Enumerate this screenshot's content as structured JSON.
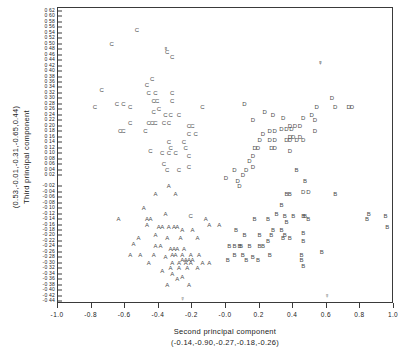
{
  "chart_data": {
    "type": "scatter",
    "title": "",
    "xlabel": "Second principal component",
    "xlabel_sub": "(-0.14,-0.90,-0.27,-0.18,-0.26)",
    "ylabel": "Third principal component",
    "ylabel_sub": "(0.53,-0.01,-0.31,-0.65,0.44)",
    "xlim": [
      -1.0,
      1.0
    ],
    "ylim": [
      -0.45,
      0.63
    ],
    "grid": false,
    "legend": "none",
    "x_ticks": [
      -1.0,
      -0.8,
      -0.6,
      -0.4,
      -0.2,
      -0.0,
      0.2,
      0.4,
      0.6,
      0.8,
      1.0
    ],
    "x_tick_labels": [
      "-1.0",
      "-0.8",
      "-0.6",
      "-0.4",
      "-0.2",
      "-0.0",
      "0.2",
      "0.4",
      "0.6",
      "0.8",
      "1.0"
    ],
    "y_ticks": [
      0.62,
      0.6,
      0.58,
      0.56,
      0.54,
      0.52,
      0.5,
      0.48,
      0.46,
      0.44,
      0.42,
      0.4,
      0.38,
      0.36,
      0.34,
      0.32,
      0.3,
      0.28,
      0.26,
      0.24,
      0.22,
      0.2,
      0.18,
      0.16,
      0.14,
      0.12,
      0.1,
      0.08,
      0.06,
      0.04,
      0.02,
      -0.02,
      -0.04,
      -0.06,
      -0.08,
      -0.1,
      -0.12,
      -0.14,
      -0.16,
      -0.18,
      -0.2,
      -0.22,
      -0.24,
      -0.26,
      -0.28,
      -0.3,
      -0.32,
      -0.34,
      -0.36,
      -0.38,
      -0.4,
      -0.42,
      -0.44
    ],
    "y_tick_labels": [
      "0 62",
      "0 60",
      "0 58",
      "0 56",
      "0 54",
      "0 52",
      "0 50",
      "0 48",
      "0 46",
      "0 44",
      "0 42",
      "0 40",
      "0 38",
      "0 36",
      "0 34",
      "0 32",
      "0 30",
      "0 28",
      "0 26",
      "0 24",
      "0 22",
      "0 20",
      "0 18",
      "0 16",
      "0 14",
      "0 12",
      "0 10",
      "0 08",
      "0 06",
      "0 04",
      "0 02",
      "-0 02",
      "-0 04",
      "-0 06",
      "-0 08",
      "-0 10",
      "-0 12",
      "-0 14",
      "-0 16",
      "-0 18",
      "-0 20",
      "-0 22",
      "-0 24",
      "-0 26",
      "-0 28",
      "-0 30",
      "-0 32",
      "-0 34",
      "-0 36",
      "-0 38",
      "-0 40",
      "-0 42",
      "-0 44"
    ],
    "marker_style": "letter-glyph",
    "series": [
      {
        "name": "A",
        "label": "A",
        "marker": "A",
        "color": "#4a4a4a",
        "points": [
          [
            -0.64,
            -0.14
          ],
          [
            -0.49,
            -0.1
          ],
          [
            -0.47,
            -0.14
          ],
          [
            -0.47,
            -0.16
          ],
          [
            -0.4,
            -0.17
          ],
          [
            -0.38,
            -0.17
          ],
          [
            -0.34,
            -0.17
          ],
          [
            -0.31,
            -0.17
          ],
          [
            -0.29,
            -0.17
          ],
          [
            -0.42,
            -0.2
          ],
          [
            -0.52,
            -0.21
          ],
          [
            -0.35,
            -0.21
          ],
          [
            -0.27,
            -0.21
          ],
          [
            -0.55,
            -0.23
          ],
          [
            -0.42,
            -0.24
          ],
          [
            -0.39,
            -0.24
          ],
          [
            -0.33,
            -0.25
          ],
          [
            -0.31,
            -0.25
          ],
          [
            -0.29,
            -0.25
          ],
          [
            -0.25,
            -0.25
          ],
          [
            -0.57,
            -0.27
          ],
          [
            -0.51,
            -0.27
          ],
          [
            -0.43,
            -0.27
          ],
          [
            -0.32,
            -0.27
          ],
          [
            -0.3,
            -0.27
          ],
          [
            -0.26,
            -0.27
          ],
          [
            -0.21,
            -0.27
          ],
          [
            -0.36,
            -0.28
          ],
          [
            -0.26,
            -0.29
          ],
          [
            -0.24,
            -0.29
          ],
          [
            -0.22,
            -0.29
          ],
          [
            -0.2,
            -0.29
          ],
          [
            -0.16,
            -0.27
          ],
          [
            -0.46,
            -0.3
          ],
          [
            -0.32,
            -0.3
          ],
          [
            -0.28,
            -0.3
          ],
          [
            -0.24,
            -0.3
          ],
          [
            -0.21,
            -0.3
          ],
          [
            -0.14,
            -0.3
          ],
          [
            -0.1,
            -0.3
          ],
          [
            -0.33,
            -0.32
          ],
          [
            -0.28,
            -0.32
          ],
          [
            -0.23,
            -0.32
          ],
          [
            -0.17,
            -0.32
          ],
          [
            -0.38,
            -0.33
          ],
          [
            -0.32,
            -0.34
          ],
          [
            -0.26,
            -0.35
          ],
          [
            -0.29,
            -0.36
          ],
          [
            -0.35,
            -0.38
          ],
          [
            -0.22,
            -0.38
          ],
          [
            -0.45,
            -0.14
          ],
          [
            -0.36,
            -0.12
          ],
          [
            -0.3,
            -0.05
          ],
          [
            -0.12,
            -0.14
          ],
          [
            -0.1,
            -0.16
          ],
          [
            -0.04,
            -0.16
          ],
          [
            -0.2,
            -0.18
          ],
          [
            -0.17,
            -0.21
          ],
          [
            -0.26,
            -0.18
          ],
          [
            -0.42,
            -0.05
          ],
          [
            -0.34,
            -0.02
          ]
        ]
      },
      {
        "name": "B",
        "label": "B",
        "marker": "B",
        "color": "#4a4a4a",
        "points": [
          [
            0.33,
            -0.09
          ],
          [
            0.3,
            -0.12
          ],
          [
            0.35,
            -0.13
          ],
          [
            0.4,
            -0.13
          ],
          [
            0.46,
            -0.13
          ],
          [
            0.85,
            -0.12
          ],
          [
            0.84,
            -0.14
          ],
          [
            0.25,
            -0.14
          ],
          [
            0.36,
            -0.15
          ],
          [
            0.17,
            -0.14
          ],
          [
            0.49,
            -0.14
          ],
          [
            0.28,
            -0.18
          ],
          [
            0.33,
            -0.18
          ],
          [
            0.35,
            -0.2
          ],
          [
            0.46,
            -0.19
          ],
          [
            0.06,
            -0.18
          ],
          [
            0.11,
            -0.2
          ],
          [
            0.2,
            -0.2
          ],
          [
            0.27,
            -0.2
          ],
          [
            0.34,
            -0.21
          ],
          [
            0.38,
            -0.21
          ],
          [
            0.25,
            -0.22
          ],
          [
            0.46,
            -0.22
          ],
          [
            0.02,
            -0.24
          ],
          [
            0.05,
            -0.24
          ],
          [
            0.08,
            -0.24
          ],
          [
            0.09,
            -0.24
          ],
          [
            0.14,
            -0.24
          ],
          [
            0.2,
            -0.24
          ],
          [
            0.22,
            -0.24
          ],
          [
            0.05,
            -0.27
          ],
          [
            0.1,
            -0.27
          ],
          [
            0.16,
            -0.28
          ],
          [
            0.26,
            -0.27
          ],
          [
            0.45,
            -0.27
          ],
          [
            0.45,
            -0.29
          ],
          [
            0.57,
            -0.26
          ],
          [
            0.01,
            -0.29
          ],
          [
            0.12,
            -0.29
          ],
          [
            0.19,
            -0.29
          ],
          [
            0.47,
            -0.13
          ],
          [
            0.46,
            -0.31
          ],
          [
            0.36,
            -0.05
          ],
          [
            0.38,
            -0.05
          ],
          [
            0.65,
            -0.05
          ],
          [
            0.95,
            -0.13
          ],
          [
            0.96,
            -0.17
          ],
          [
            0.47,
            0.0
          ],
          [
            0.42,
            0.04
          ]
        ]
      },
      {
        "name": "C",
        "label": "C",
        "marker": "C",
        "color": "#4a4a4a",
        "points": [
          [
            -0.53,
            0.55
          ],
          [
            -0.68,
            0.5
          ],
          [
            -0.35,
            0.47
          ],
          [
            -0.74,
            0.33
          ],
          [
            -0.78,
            0.27
          ],
          [
            -0.65,
            0.28
          ],
          [
            -0.61,
            0.28
          ],
          [
            -0.57,
            0.27
          ],
          [
            -0.47,
            0.35
          ],
          [
            -0.44,
            0.37
          ],
          [
            -0.46,
            0.32
          ],
          [
            -0.42,
            0.32
          ],
          [
            -0.43,
            0.29
          ],
          [
            -0.41,
            0.29
          ],
          [
            -0.32,
            0.32
          ],
          [
            -0.32,
            0.29
          ],
          [
            -0.43,
            0.25
          ],
          [
            -0.4,
            0.26
          ],
          [
            -0.36,
            0.24
          ],
          [
            -0.33,
            0.24
          ],
          [
            -0.28,
            0.24
          ],
          [
            -0.57,
            0.21
          ],
          [
            -0.46,
            0.21
          ],
          [
            -0.44,
            0.21
          ],
          [
            -0.42,
            0.21
          ],
          [
            -0.37,
            0.21
          ],
          [
            -0.34,
            0.21
          ],
          [
            -0.48,
            0.18
          ],
          [
            -0.63,
            0.18
          ],
          [
            -0.61,
            0.18
          ],
          [
            -0.22,
            0.2
          ],
          [
            -0.2,
            0.2
          ],
          [
            -0.22,
            0.17
          ],
          [
            -0.18,
            0.17
          ],
          [
            -0.34,
            0.14
          ],
          [
            -0.33,
            0.12
          ],
          [
            -0.45,
            0.11
          ],
          [
            -0.38,
            0.1
          ],
          [
            -0.34,
            0.1
          ],
          [
            -0.3,
            0.1
          ],
          [
            -0.22,
            0.09
          ],
          [
            -0.24,
            0.12
          ],
          [
            -0.25,
            0.14
          ],
          [
            -0.37,
            0.06
          ],
          [
            -0.35,
            0.04
          ],
          [
            -0.28,
            0.04
          ],
          [
            -0.22,
            0.05
          ],
          [
            -0.14,
            0.27
          ],
          [
            -0.32,
            0.45
          ],
          [
            -0.21,
            -0.13
          ]
        ]
      },
      {
        "name": "D",
        "label": "D",
        "marker": "D",
        "color": "#4a4a4a",
        "points": [
          [
            0.63,
            0.3
          ],
          [
            0.65,
            0.27
          ],
          [
            0.73,
            0.27
          ],
          [
            0.75,
            0.27
          ],
          [
            0.54,
            0.27
          ],
          [
            0.51,
            0.24
          ],
          [
            0.46,
            0.23
          ],
          [
            0.53,
            0.22
          ],
          [
            0.28,
            0.24
          ],
          [
            0.16,
            0.22
          ],
          [
            0.38,
            0.2
          ],
          [
            0.41,
            0.2
          ],
          [
            0.44,
            0.2
          ],
          [
            0.33,
            0.19
          ],
          [
            0.36,
            0.19
          ],
          [
            0.39,
            0.19
          ],
          [
            0.26,
            0.18
          ],
          [
            0.29,
            0.18
          ],
          [
            0.22,
            0.17
          ],
          [
            0.53,
            0.18
          ],
          [
            0.38,
            0.16
          ],
          [
            0.4,
            0.16
          ],
          [
            0.44,
            0.16
          ],
          [
            0.2,
            0.15
          ],
          [
            0.26,
            0.15
          ],
          [
            0.29,
            0.15
          ],
          [
            0.36,
            0.15
          ],
          [
            0.38,
            0.15
          ],
          [
            0.42,
            0.15
          ],
          [
            0.46,
            0.15
          ],
          [
            0.17,
            0.12
          ],
          [
            0.19,
            0.12
          ],
          [
            0.27,
            0.12
          ],
          [
            0.29,
            0.12
          ],
          [
            0.38,
            0.11
          ],
          [
            0.16,
            0.09
          ],
          [
            0.14,
            0.07
          ],
          [
            0.16,
            0.05
          ],
          [
            0.12,
            0.04
          ],
          [
            0.05,
            0.04
          ],
          [
            0.1,
            0.02
          ],
          [
            0.07,
            0.0
          ],
          [
            0.0,
            0.01
          ],
          [
            0.08,
            -0.02
          ],
          [
            0.46,
            -0.04
          ],
          [
            0.49,
            -0.04
          ],
          [
            0.11,
            0.28
          ],
          [
            0.23,
            0.25
          ],
          [
            0.34,
            0.23
          ]
        ]
      },
      {
        "name": "bold-markers",
        "label": "bold",
        "marker": "filled",
        "color": "#000000",
        "points": [
          [
            -0.36,
            0.48
          ],
          [
            0.56,
            0.43
          ]
        ]
      },
      {
        "name": "open-circle-markers",
        "label": "open",
        "marker": "circle",
        "color": "#555555",
        "points": [
          [
            -0.26,
            -0.43
          ],
          [
            0.6,
            -0.42
          ]
        ]
      }
    ]
  }
}
